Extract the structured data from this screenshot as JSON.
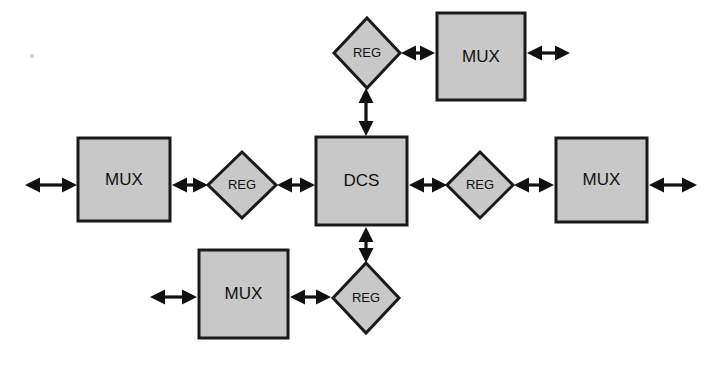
{
  "diagram": {
    "type": "block-diagram",
    "canvas": {
      "width": 721,
      "height": 370,
      "background": "#ffffff"
    },
    "style": {
      "shape_fill": "#c8c8c8",
      "shape_stroke": "#1a1a1a",
      "arrow_color": "#111111",
      "text_color": "#111111",
      "shape_stroke_width": 3
    },
    "labels": {
      "dcs": "DCS",
      "mux": "MUX",
      "reg": "REG"
    },
    "nodes": [
      {
        "id": "dcs-center",
        "label": "DCS",
        "shape": "rect",
        "x": 316,
        "y": 137,
        "width": 91,
        "height": 88
      },
      {
        "id": "mux-left",
        "label": "MUX",
        "shape": "rect",
        "x": 78,
        "y": 138,
        "width": 92,
        "height": 83
      },
      {
        "id": "mux-right",
        "label": "MUX",
        "shape": "rect",
        "x": 556,
        "y": 138,
        "width": 91,
        "height": 84
      },
      {
        "id": "mux-top",
        "label": "MUX",
        "shape": "rect",
        "x": 437,
        "y": 13,
        "width": 88,
        "height": 87
      },
      {
        "id": "mux-bottom",
        "label": "MUX",
        "shape": "rect",
        "x": 199,
        "y": 250,
        "width": 89,
        "height": 88
      },
      {
        "id": "reg-left",
        "label": "REG",
        "shape": "diamond",
        "cx": 242,
        "cy": 185,
        "rx": 34,
        "ry": 33
      },
      {
        "id": "reg-right",
        "label": "REG",
        "shape": "diamond",
        "cx": 480,
        "cy": 185,
        "rx": 33,
        "ry": 33
      },
      {
        "id": "reg-top",
        "label": "REG",
        "shape": "diamond",
        "cx": 367,
        "cy": 53,
        "rx": 33,
        "ry": 35
      },
      {
        "id": "reg-bottom",
        "label": "REG",
        "shape": "diamond",
        "cx": 366,
        "cy": 298,
        "rx": 33,
        "ry": 35
      }
    ],
    "connectors": [
      {
        "id": "arrow-left-external",
        "orientation": "horizontal",
        "from": 25,
        "to": 77,
        "pos": 185,
        "heads": "both"
      },
      {
        "id": "arrow-muxleft-regleft",
        "orientation": "horizontal",
        "from": 172,
        "to": 208,
        "pos": 185,
        "heads": "both"
      },
      {
        "id": "arrow-regleft-dcs",
        "orientation": "horizontal",
        "from": 277,
        "to": 315,
        "pos": 185,
        "heads": "both"
      },
      {
        "id": "arrow-dcs-regright",
        "orientation": "horizontal",
        "from": 409,
        "to": 447,
        "pos": 185,
        "heads": "both"
      },
      {
        "id": "arrow-regright-muxright",
        "orientation": "horizontal",
        "from": 514,
        "to": 554,
        "pos": 185,
        "heads": "both"
      },
      {
        "id": "arrow-right-external",
        "orientation": "horizontal",
        "from": 649,
        "to": 697,
        "pos": 185,
        "heads": "both"
      },
      {
        "id": "arrow-dcs-regtop",
        "orientation": "vertical",
        "from": 88,
        "to": 136,
        "pos": 366,
        "heads": "both"
      },
      {
        "id": "arrow-regtop-muxtop",
        "orientation": "horizontal",
        "from": 401,
        "to": 435,
        "pos": 53,
        "heads": "both"
      },
      {
        "id": "arrow-muxtop-external",
        "orientation": "horizontal",
        "from": 527,
        "to": 570,
        "pos": 53,
        "heads": "both"
      },
      {
        "id": "arrow-dcs-regbottom",
        "orientation": "vertical",
        "from": 227,
        "to": 263,
        "pos": 366,
        "heads": "both"
      },
      {
        "id": "arrow-muxbottom-regbottom",
        "orientation": "horizontal",
        "from": 290,
        "to": 331,
        "pos": 297,
        "heads": "both"
      },
      {
        "id": "arrow-muxbottom-external",
        "orientation": "horizontal",
        "from": 150,
        "to": 197,
        "pos": 297,
        "heads": "both"
      }
    ],
    "artifacts": [
      {
        "id": "scan-speck",
        "cx": 32,
        "cy": 56,
        "r": 2
      }
    ]
  }
}
